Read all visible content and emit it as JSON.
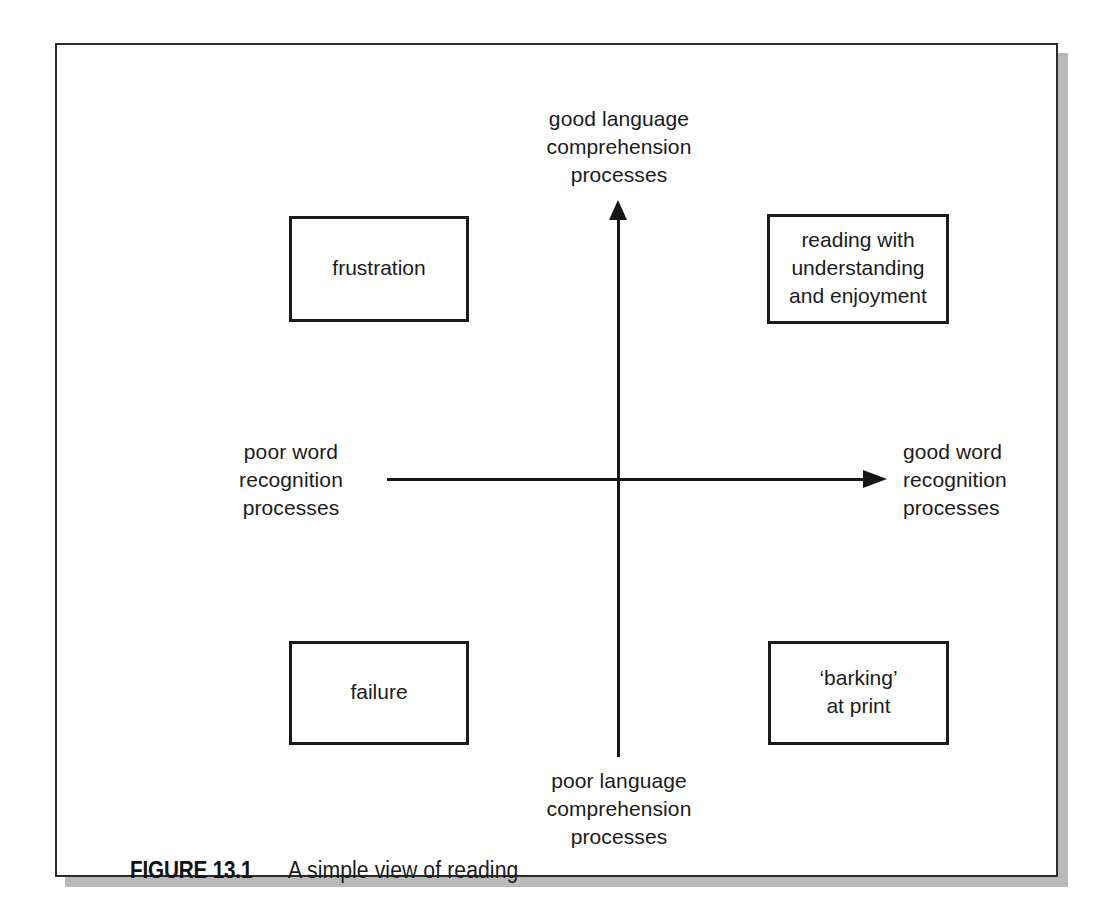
{
  "figure": {
    "caption_label": "FIGURE 13.1",
    "caption_text": "A simple view of reading"
  },
  "chart_data": {
    "type": "scatter",
    "title": "A simple view of reading",
    "subtitle": "",
    "layout": "two-by-two quadrant diagram with crossed arrow axes",
    "xlabel": "word recognition processes",
    "ylabel": "language comprehension processes",
    "x_axis": {
      "low_label": "poor word\nrecognition\nprocesses",
      "high_label": "good word\nrecognition\nprocesses",
      "arrow": "right"
    },
    "y_axis": {
      "low_label": "poor language\ncomprehension\nprocesses",
      "high_label": "good language\ncomprehension\nprocesses",
      "arrow": "up"
    },
    "grid": false,
    "legend": "none",
    "quadrants": [
      {
        "position": "top-left",
        "x": "poor word recognition",
        "y": "good language comprehension",
        "label": "frustration"
      },
      {
        "position": "top-right",
        "x": "good word recognition",
        "y": "good language comprehension",
        "label": "reading with\nunderstanding\nand enjoyment"
      },
      {
        "position": "bottom-left",
        "x": "poor word recognition",
        "y": "poor language comprehension",
        "label": "failure"
      },
      {
        "position": "bottom-right",
        "x": "good word recognition",
        "y": "poor language comprehension",
        "label": "‘barking’\nat print"
      }
    ]
  },
  "colors": {
    "ink": "#1b1b1b",
    "frame": "#2b2b2b",
    "shadow": "#b9b9b9",
    "page": "#ffffff"
  }
}
